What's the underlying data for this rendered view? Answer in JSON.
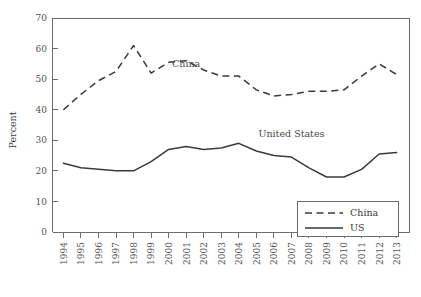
{
  "chart_data": {
    "type": "line",
    "title": "",
    "xlabel": "",
    "ylabel": "Percent",
    "ylim": [
      0,
      70
    ],
    "yticks": [
      0,
      10,
      20,
      30,
      40,
      50,
      60,
      70
    ],
    "grid": false,
    "legend_position": "bottom-right",
    "categories": [
      "1994",
      "1995",
      "1996",
      "1997",
      "1998",
      "1999",
      "2000",
      "2001",
      "2002",
      "2003",
      "2004",
      "2005",
      "2006",
      "2007",
      "2008",
      "2009",
      "2010",
      "2011",
      "2012",
      "2013"
    ],
    "series": [
      {
        "name": "China",
        "style": "dashed",
        "color": "#3a3a3a",
        "values": [
          40,
          45,
          49.5,
          52.5,
          61,
          52,
          55.5,
          56,
          53,
          51,
          51,
          46.5,
          44.5,
          45,
          46,
          46,
          46.5,
          51,
          55,
          51.5
        ]
      },
      {
        "name": "US",
        "style": "solid",
        "color": "#3a3a3a",
        "values": [
          22.5,
          21,
          20.5,
          20,
          20,
          23,
          27,
          28,
          27,
          27.5,
          29,
          26.5,
          25,
          24.5,
          21,
          18,
          18,
          20.5,
          25.5,
          26
        ]
      }
    ],
    "annotations": [
      {
        "text": "China",
        "x": "2001",
        "y": 54
      },
      {
        "text": "United States",
        "x": "2007",
        "y": 31
      }
    ],
    "legend": [
      {
        "label": "China",
        "style": "dashed"
      },
      {
        "label": "US",
        "style": "solid"
      }
    ]
  }
}
